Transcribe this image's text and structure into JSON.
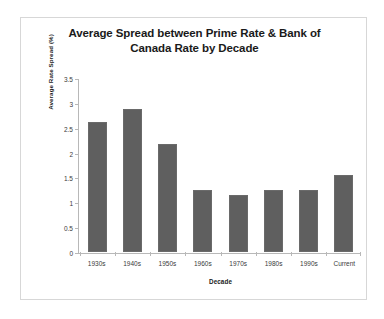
{
  "chart_data": {
    "type": "bar",
    "title": "Average Spread between Prime Rate & Bank of Canada Rate by Decade",
    "title_line1": "Average Spread between Prime Rate & Bank of",
    "title_line2": "Canada Rate by Decade",
    "xlabel": "Decade",
    "ylabel": "Average Rate Spread (%)",
    "categories": [
      "1930s",
      "1940s",
      "1950s",
      "1960s",
      "1970s",
      "1980s",
      "1990s",
      "Current"
    ],
    "values": [
      2.62,
      2.88,
      2.18,
      1.25,
      1.15,
      1.24,
      1.25,
      1.55
    ],
    "ylim": [
      0,
      3.5
    ],
    "ytick_labels": [
      "3.5",
      "3",
      "2.5",
      "2",
      "1.5",
      "1",
      "0.5",
      "0"
    ],
    "ytick_values": [
      3.5,
      3,
      2.5,
      2,
      1.5,
      1,
      0.5,
      0
    ],
    "grid": false,
    "legend": "none",
    "bar_color": "#5f5f5f",
    "axis_color": "#b8b8b8",
    "border_color": "#d7d7d7",
    "background": "#ffffff"
  }
}
